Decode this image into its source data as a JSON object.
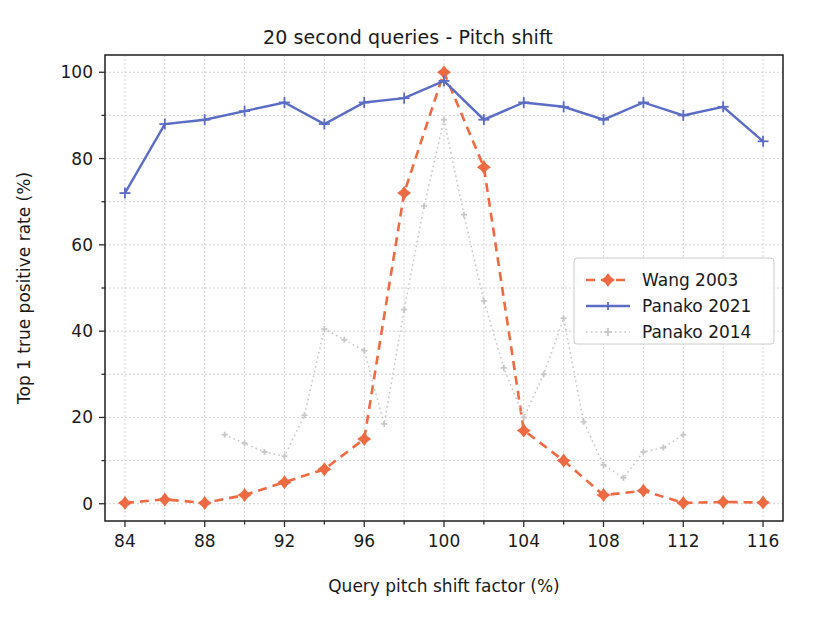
{
  "chart_data": {
    "type": "line",
    "title": "20 second queries - Pitch shift",
    "xlabel": "Query pitch shift factor (%)",
    "ylabel": "Top 1 true positive rate (%)",
    "xlim": [
      83,
      117
    ],
    "ylim": [
      -4,
      104
    ],
    "xticks": [
      84,
      88,
      92,
      96,
      100,
      104,
      108,
      112,
      116
    ],
    "xticks_minor": [
      86,
      90,
      94,
      98,
      102,
      106,
      110,
      114
    ],
    "yticks": [
      0,
      20,
      40,
      60,
      80,
      100
    ],
    "yticks_minor": [
      10,
      30,
      50,
      70,
      90
    ],
    "grid": true,
    "legend_position": "center right",
    "series": [
      {
        "name": "Wang 2003",
        "color": "#ED6A43",
        "linestyle": "dashed",
        "marker": "diamond",
        "x": [
          84,
          86,
          88,
          90,
          92,
          94,
          96,
          98,
          100,
          102,
          104,
          106,
          108,
          110,
          112,
          114,
          116
        ],
        "values": [
          0.2,
          1.0,
          0.2,
          2.0,
          5.0,
          8.0,
          15.0,
          72.0,
          100.0,
          78.0,
          17.0,
          10.0,
          2.0,
          3.0,
          0.2,
          0.4,
          0.3
        ]
      },
      {
        "name": "Panako 2021",
        "color": "#5B6CC4",
        "linestyle": "solid",
        "marker": "plus",
        "x": [
          84,
          86,
          88,
          90,
          92,
          94,
          96,
          98,
          100,
          102,
          104,
          106,
          108,
          110,
          112,
          114,
          116
        ],
        "values": [
          72.0,
          88.0,
          89.0,
          91.0,
          93.0,
          88.0,
          93.0,
          94.0,
          98.0,
          89.0,
          93.0,
          92.0,
          89.0,
          93.0,
          90.0,
          92.0,
          84.0
        ]
      },
      {
        "name": "Panako 2014",
        "color": "#C8C8C8",
        "linestyle": "dotted",
        "marker": "plus",
        "x": [
          89,
          90,
          91,
          92,
          93,
          94,
          95,
          96,
          97,
          98,
          99,
          100,
          101,
          102,
          103,
          104,
          105,
          106,
          107,
          108,
          109,
          110,
          111,
          112
        ],
        "values": [
          16.0,
          14.0,
          12.0,
          11.0,
          20.5,
          40.5,
          38.0,
          35.5,
          18.5,
          45.0,
          69.0,
          89.0,
          67.0,
          47.0,
          31.5,
          20.0,
          30.0,
          43.0,
          19.0,
          9.0,
          6.0,
          12.0,
          13.0,
          16.0
        ]
      }
    ]
  },
  "legend": {
    "entries": [
      {
        "label": "Wang 2003"
      },
      {
        "label": "Panako 2021"
      },
      {
        "label": "Panako 2014"
      }
    ]
  },
  "axes": {
    "x_tick_labels": [
      "84",
      "88",
      "92",
      "96",
      "100",
      "104",
      "108",
      "112",
      "116"
    ],
    "y_tick_labels": [
      "0",
      "20",
      "40",
      "60",
      "80",
      "100"
    ]
  }
}
